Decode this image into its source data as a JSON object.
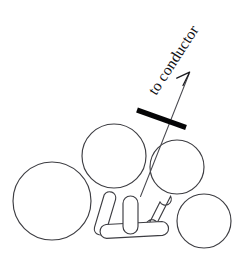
{
  "figure": {
    "background_color": "#ffffff",
    "stroke_color": "#3d3d42",
    "marker_color": "#050506",
    "text_color": "#111114",
    "width": 246,
    "height": 253
  },
  "callout": {
    "label": "to conductor",
    "rotation_deg": -57,
    "anchor_x": 156,
    "anchor_y": 96
  },
  "annotations": {
    "arrow_name": "leader-arrow-to-conductor",
    "marker_name": "cut-plane-marker-bar"
  },
  "diagram_data": {
    "type": "line-drawing",
    "circles": [
      {
        "name": "strand-large-left",
        "cx": 52,
        "cy": 201,
        "r": 39
      },
      {
        "name": "strand-top-middle",
        "cx": 114,
        "cy": 156,
        "r": 32
      },
      {
        "name": "strand-upper-right",
        "cx": 177,
        "cy": 167,
        "r": 27
      },
      {
        "name": "strand-lower-right",
        "cx": 204,
        "cy": 221,
        "r": 27
      }
    ],
    "capsules": [
      {
        "name": "rod-left-diagonal",
        "x1": 110,
        "y1": 200,
        "x2": 100,
        "y2": 228,
        "w": 11
      },
      {
        "name": "rod-bottom-horizontal",
        "x1": 106,
        "y1": 231,
        "x2": 162,
        "y2": 226,
        "w": 12
      },
      {
        "name": "rod-center-vertical",
        "x1": 130,
        "y1": 203,
        "x2": 130,
        "y2": 228,
        "w": 13
      },
      {
        "name": "rod-right-diagonal",
        "x1": 165,
        "y1": 199,
        "x2": 152,
        "y2": 226,
        "w": 11
      }
    ],
    "leader_line": {
      "x1": 140,
      "y1": 196,
      "x2": 189,
      "y2": 73
    },
    "marker_bar": {
      "x1": 137,
      "y1": 110,
      "x2": 186,
      "y2": 127
    }
  }
}
